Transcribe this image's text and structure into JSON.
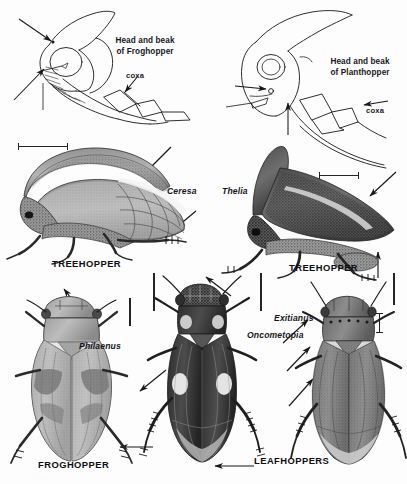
{
  "plate": {
    "width": 407,
    "height": 484,
    "background": "#fdfdfd",
    "ink": "#17171b",
    "description": "Black-and-white scientific illustration plate of Hemiptera: head-and-beak line diagrams of a froghopper and a planthopper at top, shaded halftone drawings of two treehoppers, a froghopper, and two leafhoppers below."
  },
  "diagrams": {
    "froghopper_head": {
      "callout": "Head and beak\nof Froghopper",
      "coxa_label": "coxa"
    },
    "planthopper_head": {
      "callout": "Head and beak\nof Planthopper",
      "coxa_label": "coxa"
    }
  },
  "figures": [
    {
      "id": "treehopper-ceresa",
      "genus": "Ceresa",
      "caption": "TREEHOPPER",
      "view": "lateral"
    },
    {
      "id": "treehopper-thelia",
      "genus": "Thelia",
      "caption": "TREEHOPPER",
      "view": "lateral"
    },
    {
      "id": "froghopper-philaenus",
      "genus": "Philaenus",
      "caption": "FROGHOPPER",
      "view": "dorsal"
    },
    {
      "id": "leafhopper-oncometopia",
      "genus": "Oncometopia",
      "caption": "LEAFHOPPERS",
      "view": "dorsal"
    },
    {
      "id": "leafhopper-exitianus",
      "genus": "Exitianus",
      "caption": "LEAFHOPPERS",
      "view": "dorsal"
    }
  ],
  "labels": {
    "head_beak_froghopper": "Head and beak\nof Froghopper",
    "head_beak_planthopper": "Head and beak\nof Planthopper",
    "coxa_left": "coxa",
    "coxa_right": "coxa",
    "ceresa": "Ceresa",
    "thelia": "Thelia",
    "philaenus": "Philaenus",
    "oncometopia": "Oncometopia",
    "exitianus": "Exitianus",
    "treehopper_left": "TREEHOPPER",
    "treehopper_right": "TREEHOPPER",
    "froghopper": "FROGHOPPER",
    "leafhoppers": "LEAFHOPPERS"
  },
  "scale_bars": [
    {
      "id": "bar-ceresa",
      "orientation": "horizontal"
    },
    {
      "id": "bar-thelia",
      "orientation": "horizontal"
    },
    {
      "id": "bar-philaenus",
      "orientation": "vertical"
    },
    {
      "id": "bar-onco-left",
      "orientation": "vertical"
    },
    {
      "id": "bar-onco-right",
      "orientation": "vertical"
    },
    {
      "id": "bar-exit-left",
      "orientation": "vertical"
    },
    {
      "id": "bar-exit-right",
      "orientation": "vertical"
    }
  ]
}
